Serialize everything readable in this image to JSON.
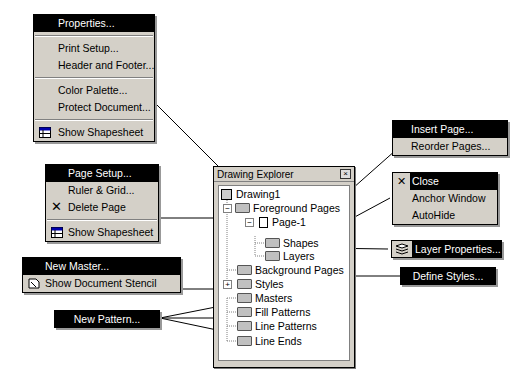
{
  "menus": {
    "document_menu": {
      "items": [
        {
          "label": "Properties...",
          "highlighted": true
        },
        {
          "label": "Print Setup..."
        },
        {
          "label": "Header and Footer..."
        },
        {
          "label": "Color Palette..."
        },
        {
          "label": "Protect Document..."
        },
        {
          "label": "Show Shapesheet",
          "icon": "shapesheet-icon"
        }
      ]
    },
    "page_menu": {
      "items": [
        {
          "label": "Page Setup...",
          "highlighted": true
        },
        {
          "label": "Ruler & Grid..."
        },
        {
          "label": "Delete Page",
          "icon": "delete-x-icon"
        },
        {
          "label": "Show Shapesheet",
          "icon": "shapesheet-icon"
        }
      ]
    },
    "masters_menu": {
      "items": [
        {
          "label": "New Master...",
          "highlighted": true
        },
        {
          "label": "Show Document Stencil",
          "icon": "stencil-icon"
        }
      ]
    },
    "pattern_button": {
      "label": "New Pattern..."
    },
    "foreground_menu": {
      "items": [
        {
          "label": "Insert Page...",
          "highlighted": true
        },
        {
          "label": "Reorder Pages..."
        }
      ]
    },
    "window_menu": {
      "items": [
        {
          "label": "Close",
          "highlighted": true,
          "icon": "close-x-icon"
        },
        {
          "label": "Anchor Window"
        },
        {
          "label": "AutoHide"
        }
      ]
    },
    "layer_button": {
      "label": "Layer Properties...",
      "icon": "layers-icon"
    },
    "styles_button": {
      "label": "Define Styles..."
    }
  },
  "explorer": {
    "title": "Drawing Explorer",
    "close_glyph": "×",
    "nodes": [
      {
        "label": "Drawing1"
      },
      {
        "label": "Foreground Pages",
        "expander": "−"
      },
      {
        "label": "Page-1",
        "expander": "−"
      },
      {
        "label": "Shapes"
      },
      {
        "label": "Layers"
      },
      {
        "label": "Background Pages"
      },
      {
        "label": "Styles",
        "expander": "+"
      },
      {
        "label": "Masters"
      },
      {
        "label": "Fill Patterns"
      },
      {
        "label": "Line Patterns"
      },
      {
        "label": "Line Ends"
      }
    ]
  }
}
